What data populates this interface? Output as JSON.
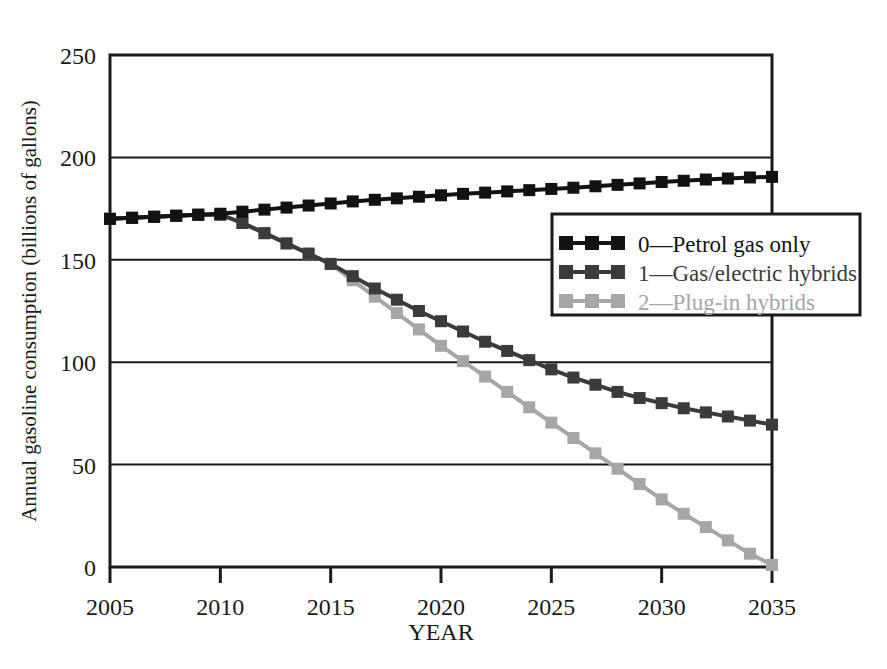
{
  "chart_data": {
    "type": "line",
    "title": "",
    "xlabel": "YEAR",
    "ylabel": "Annual gasoline consumption (billions of gallons)",
    "xlim": [
      2005,
      2035
    ],
    "ylim": [
      0,
      250
    ],
    "xticks": [
      2005,
      2010,
      2015,
      2020,
      2025,
      2030,
      2035
    ],
    "xtick_labels": [
      "2005",
      "2010",
      "2015",
      "2020",
      "2025",
      "2030",
      "2035"
    ],
    "yticks": [
      0,
      50,
      100,
      150,
      200,
      250
    ],
    "ytick_labels": [
      "0",
      "50",
      "100",
      "150",
      "200",
      "250"
    ],
    "grid": "horizontal",
    "legend_position": "center-right",
    "marker": "square",
    "x": [
      2005,
      2006,
      2007,
      2008,
      2009,
      2010,
      2011,
      2012,
      2013,
      2014,
      2015,
      2016,
      2017,
      2018,
      2019,
      2020,
      2021,
      2022,
      2023,
      2024,
      2025,
      2026,
      2027,
      2028,
      2029,
      2030,
      2031,
      2032,
      2033,
      2034,
      2035
    ],
    "series": [
      {
        "name": "0—Petrol gas only",
        "key": "petrol",
        "color": "#121212",
        "values": [
          170,
          170.5,
          171,
          171.5,
          172,
          172.5,
          173.5,
          174.5,
          175.5,
          176.5,
          177.5,
          178.5,
          179.3,
          180,
          180.8,
          181.5,
          182.2,
          182.8,
          183.4,
          184,
          184.6,
          185.2,
          185.9,
          186.6,
          187.3,
          188,
          188.6,
          189.2,
          189.7,
          190.2,
          190.5
        ]
      },
      {
        "name": "1—Gas/electric hybrids",
        "key": "hybrid",
        "color": "#3b3b3b",
        "values": [
          170,
          170.5,
          171,
          171.5,
          172,
          172,
          168,
          163,
          158,
          153,
          148,
          142,
          136,
          130.5,
          125,
          120,
          115,
          110,
          105.5,
          101,
          96.5,
          92.5,
          89,
          85.5,
          82.5,
          80,
          77.5,
          75.5,
          73.5,
          71.5,
          69.5
        ]
      },
      {
        "name": "2—Plug-in hybrids",
        "key": "plugin",
        "color": "#a6a6a6",
        "values": [
          170,
          170.5,
          171,
          171.5,
          172,
          172,
          168,
          163,
          158,
          153,
          148,
          140,
          132,
          124,
          116,
          108,
          100.5,
          93,
          85.5,
          78,
          70.5,
          63,
          55.5,
          48,
          40.5,
          33,
          26,
          19.5,
          13,
          6.5,
          1
        ]
      }
    ]
  },
  "axes": {
    "y_axis_title": "Annual gasoline consumption (billions of gallons)",
    "x_axis_title": "YEAR"
  },
  "legend": {
    "items": [
      {
        "label": "0—Petrol gas only",
        "color": "#121212",
        "swatch_name": "legend-swatch-petrol"
      },
      {
        "label": "1—Gas/electric hybrids",
        "color": "#3b3b3b",
        "swatch_name": "legend-swatch-hybrid"
      },
      {
        "label": "2—Plug-in hybrids",
        "color": "#a6a6a6",
        "swatch_name": "legend-swatch-plugin"
      }
    ]
  },
  "colors": {
    "axis": "#1b1b1b",
    "background": "#ffffff",
    "series_petrol": "#121212",
    "series_hybrid": "#3b3b3b",
    "series_plugin": "#a6a6a6"
  }
}
